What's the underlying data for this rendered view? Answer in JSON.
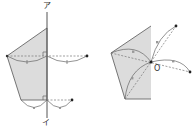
{
  "figure_left": {
    "title": "line-symmetry construction",
    "axis_top_label": "ア",
    "axis_bottom_label": "イ",
    "tick_mark": "ı"
  },
  "figure_right": {
    "title": "point-symmetry construction",
    "center_label": "O"
  },
  "colors": {
    "fill": "#d9d9d9",
    "stroke": "#555555",
    "dashed": "#777777",
    "marker": "#888888"
  }
}
